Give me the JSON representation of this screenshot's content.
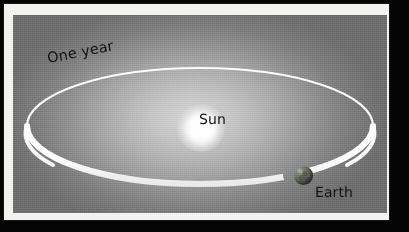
{
  "figure": {
    "frame_color": "#f2f2f0",
    "matte_color": "#050505",
    "space_color": "#9a9a9a"
  },
  "labels": {
    "one_year": "One year",
    "sun": "Sun",
    "earth": "Earth"
  },
  "bodies": {
    "sun": {
      "name": "Sun",
      "color": "#ffffff"
    },
    "earth": {
      "name": "Earth",
      "color": "#5d625a"
    }
  },
  "orbit": {
    "name": "orbit-ring",
    "color": "#ffffff",
    "period_label": "One year"
  }
}
